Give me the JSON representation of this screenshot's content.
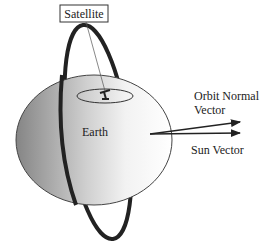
{
  "diagram": {
    "labels": {
      "satellite": "Satellite",
      "earth": "Earth",
      "orbit_normal_line1": "Orbit Normal",
      "orbit_normal_line2": "Vector",
      "sun_vector": "Sun Vector"
    },
    "colors": {
      "background": "#ffffff",
      "orbit": "#222222",
      "earth_dark": "#8a8a8a",
      "earth_light": "#ffffff",
      "stroke": "#333333"
    }
  }
}
